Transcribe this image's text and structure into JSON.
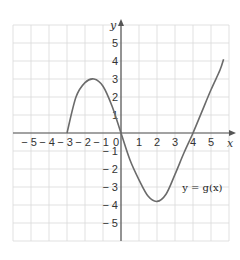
{
  "chart_data": {
    "type": "line",
    "title": "",
    "xlabel": "x",
    "ylabel": "y",
    "xlim": [
      -6,
      6
    ],
    "ylim": [
      -6,
      6
    ],
    "grid": true,
    "x_ticks": [
      "-5",
      "-4",
      "-3",
      "-2",
      "-1",
      "1",
      "2",
      "3",
      "4",
      "5"
    ],
    "y_ticks": [
      "5",
      "4",
      "3",
      "2",
      "1",
      "-1",
      "-2",
      "-3",
      "-4",
      "-5"
    ],
    "origin_label": "0",
    "series": [
      {
        "name": "y = g(x)",
        "points": [
          [
            -3,
            0
          ],
          [
            -2.5,
            2.0
          ],
          [
            -2,
            2.8
          ],
          [
            -1.5,
            3.0
          ],
          [
            -1,
            2.6
          ],
          [
            -0.5,
            1.5
          ],
          [
            0,
            0
          ],
          [
            0.5,
            -1.5
          ],
          [
            1,
            -2.6
          ],
          [
            1.5,
            -3.5
          ],
          [
            2,
            -3.8
          ],
          [
            2.5,
            -3.4
          ],
          [
            3,
            -2.3
          ],
          [
            3.5,
            -1.1
          ],
          [
            4,
            0
          ],
          [
            4.5,
            1.2
          ],
          [
            5,
            2.4
          ],
          [
            5.5,
            3.5
          ],
          [
            5.7,
            4.1
          ]
        ]
      }
    ],
    "annotations": [
      {
        "text": "y = g(x)",
        "x": 3.4,
        "y": -3.2
      }
    ],
    "colors": {
      "curve": "#6b6b6b",
      "grid": "#d9d9d9",
      "axis": "#555555"
    }
  }
}
